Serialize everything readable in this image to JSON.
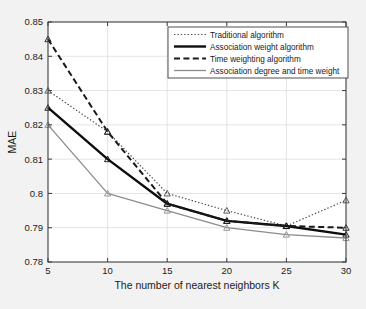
{
  "figure": {
    "background_color": "#f2f2f2",
    "plot_background_color": "#ffffff",
    "axis_color": "#3d3d3d",
    "grid_color": "#d9d9d9"
  },
  "chart_data": {
    "type": "line",
    "title": "",
    "xlabel": "The number of nearest neighbors K",
    "ylabel": "MAE",
    "x": [
      5,
      10,
      15,
      20,
      25,
      30
    ],
    "xticklabels": [
      "5",
      "10",
      "15",
      "20",
      "25",
      "30"
    ],
    "xlim": [
      5,
      30
    ],
    "ylim": [
      0.78,
      0.85
    ],
    "yticks": [
      0.78,
      0.79,
      0.8,
      0.81,
      0.82,
      0.83,
      0.84,
      0.85
    ],
    "yticklabels": [
      "0.78",
      "0.79",
      "0.8",
      "0.81",
      "0.82",
      "0.83",
      "0.84",
      "0.85"
    ],
    "grid": true,
    "legend_position": "upper right",
    "marker": "triangle",
    "series": [
      {
        "name": "Traditional algorithm",
        "values": [
          0.83,
          0.818,
          0.8,
          0.795,
          0.7905,
          0.798
        ],
        "color": "#4d4d4d",
        "linestyle": "dotted",
        "linewidth": 1.2
      },
      {
        "name": "Association weight algorithm",
        "values": [
          0.825,
          0.81,
          0.797,
          0.792,
          0.7905,
          0.788
        ],
        "color": "#0d0d0d",
        "linestyle": "solid",
        "linewidth": 2.4
      },
      {
        "name": "Time weighting algorithm",
        "values": [
          0.845,
          0.818,
          0.797,
          0.792,
          0.7905,
          0.79
        ],
        "color": "#1a1a1a",
        "linestyle": "dashed",
        "linewidth": 2.0
      },
      {
        "name": "Association degree and time weight",
        "values": [
          0.82,
          0.8,
          0.795,
          0.79,
          0.788,
          0.787
        ],
        "color": "#8c8c8c",
        "linestyle": "solid",
        "linewidth": 1.3
      }
    ]
  }
}
